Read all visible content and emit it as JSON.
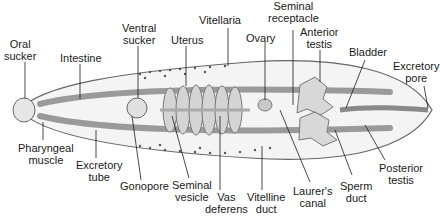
{
  "diagram": {
    "labels": {
      "oral_sucker": "Oral\nsucker",
      "intestine": "Intestine",
      "ventral_sucker": "Ventral\nsucker",
      "uterus": "Uterus",
      "vitellaria": "Vitellaria",
      "seminal_receptacle": "Seminal\nreceptacle",
      "ovary": "Ovary",
      "anterior_testis": "Anterior\ntestis",
      "bladder": "Bladder",
      "excretory_pore": "Excretory\npore",
      "pharyngeal_muscle": "Pharyngeal\nmuscle",
      "excretory_tube": "Excretory\ntube",
      "gonopore": "Gonopore",
      "seminal_vesicle": "Seminal\nvesicle",
      "vas_deferens": "Vas\ndeferens",
      "vitelline_duct": "Vitelline\nduct",
      "laurers_canal": "Laurer's\ncanal",
      "sperm_duct": "Sperm\nduct",
      "posterior_testis": "Posterior\ntestis"
    },
    "colors": {
      "body": "#f4f4f4",
      "outline": "#555555",
      "organ": "#c8c8c8",
      "label": "#1a1a1a"
    }
  }
}
